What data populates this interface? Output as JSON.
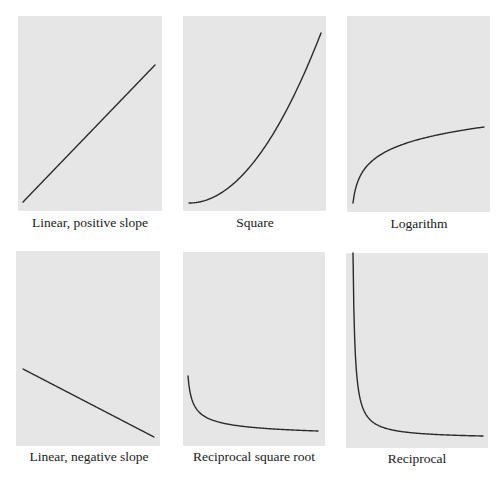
{
  "chart_data": [
    {
      "type": "line",
      "id": "linear-positive",
      "title": "Linear, positive slope",
      "function": "linear_positive",
      "axes": false,
      "grid": false,
      "panel": {
        "x": 18,
        "y": 16,
        "w": 144,
        "h": 195
      },
      "curve": {
        "x0": 5,
        "y0": 186,
        "x1": 137,
        "y1": 49
      }
    },
    {
      "type": "line",
      "id": "square",
      "title": "Square",
      "function": "square",
      "axes": false,
      "grid": false,
      "panel": {
        "x": 183,
        "y": 16,
        "w": 143,
        "h": 195
      },
      "curve": {
        "x0": 6,
        "y0": 187,
        "x1": 138,
        "y1": 17
      }
    },
    {
      "type": "line",
      "id": "logarithm",
      "title": "Logarithm",
      "function": "logarithm",
      "axes": false,
      "grid": false,
      "panel": {
        "x": 347,
        "y": 16,
        "w": 143,
        "h": 196
      },
      "curve": {
        "x0": 6,
        "y0": 187,
        "x1": 137,
        "y1": 111
      }
    },
    {
      "type": "line",
      "id": "linear-negative",
      "title": "Linear, negative slope",
      "function": "linear_negative",
      "axes": false,
      "grid": false,
      "panel": {
        "x": 16,
        "y": 251,
        "w": 144,
        "h": 195
      },
      "curve": {
        "x0": 7,
        "y0": 118,
        "x1": 138,
        "y1": 186
      }
    },
    {
      "type": "line",
      "id": "reciprocal-square-root",
      "title": "Reciprocal square root",
      "function": "reciprocal_sqrt",
      "axes": false,
      "grid": false,
      "panel": {
        "x": 183,
        "y": 252,
        "w": 142,
        "h": 194
      },
      "curve": {
        "x0": 5,
        "y0": 124,
        "x1": 135,
        "y1": 179
      }
    },
    {
      "type": "line",
      "id": "reciprocal",
      "title": "Reciprocal",
      "function": "reciprocal",
      "axes": false,
      "grid": false,
      "panel": {
        "x": 346,
        "y": 253,
        "w": 142,
        "h": 195
      },
      "curve": {
        "x0": 7,
        "y0": 0,
        "x1": 137,
        "y1": 183
      }
    }
  ],
  "labels": [
    {
      "text": "Linear, positive slope",
      "cx": 90,
      "y": 215
    },
    {
      "text": "Square",
      "cx": 255,
      "y": 215
    },
    {
      "text": "Logarithm",
      "cx": 419,
      "y": 216
    },
    {
      "text": "Linear, negative slope",
      "cx": 89,
      "y": 449
    },
    {
      "text": "Reciprocal square root",
      "cx": 254,
      "y": 449
    },
    {
      "text": "Reciprocal",
      "cx": 417,
      "y": 451
    }
  ],
  "colors": {
    "panel_fill": "#e6e6e6",
    "curve_stroke": "#2b2b2b",
    "background": "#ffffff",
    "label_text": "#1a1a1a"
  }
}
